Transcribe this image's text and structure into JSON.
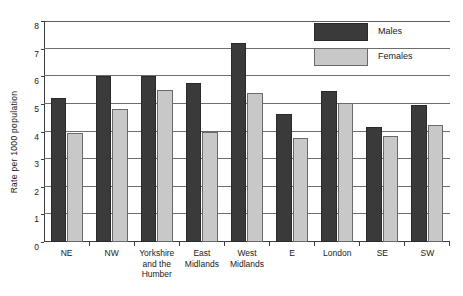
{
  "title_strip": "partially cropped heading line",
  "legend": {
    "position": "top-right",
    "entries": [
      {
        "label": "Males",
        "color": "#3a3a3a",
        "swatch": "males"
      },
      {
        "label": "Females",
        "color": "#c8c8c8",
        "swatch": "females"
      }
    ]
  },
  "chart_data": {
    "type": "bar",
    "title": "",
    "xlabel": "",
    "ylabel": "Rate per 1000 population",
    "ylim": [
      0,
      8
    ],
    "ytick_step": 1,
    "ytick_labels": [
      "0",
      "1",
      "2",
      "3",
      "4",
      "5",
      "6",
      "7",
      "8"
    ],
    "grid": true,
    "grid_axis": "y",
    "legend_position": "top-right",
    "categories": [
      "NE",
      "NW",
      "Yorkshire and the Humber",
      "East Midlands",
      "West Midlands",
      "E",
      "London",
      "SE",
      "SW"
    ],
    "category_label_lines": [
      [
        "NE"
      ],
      [
        "NW"
      ],
      [
        "Yorkshire",
        "and the",
        "Humber"
      ],
      [
        "East",
        "Midlands"
      ],
      [
        "West",
        "Midlands"
      ],
      [
        "E"
      ],
      [
        "London"
      ],
      [
        "SE"
      ],
      [
        "SW"
      ]
    ],
    "series": [
      {
        "name": "Males",
        "color": "#3a3a3a",
        "values": [
          5.2,
          6.0,
          6.0,
          5.75,
          7.2,
          4.65,
          5.45,
          4.15,
          4.95
        ]
      },
      {
        "name": "Females",
        "color": "#c8c8c8",
        "values": [
          3.95,
          4.8,
          5.5,
          4.0,
          5.4,
          3.75,
          5.05,
          3.85,
          4.25
        ]
      }
    ]
  }
}
